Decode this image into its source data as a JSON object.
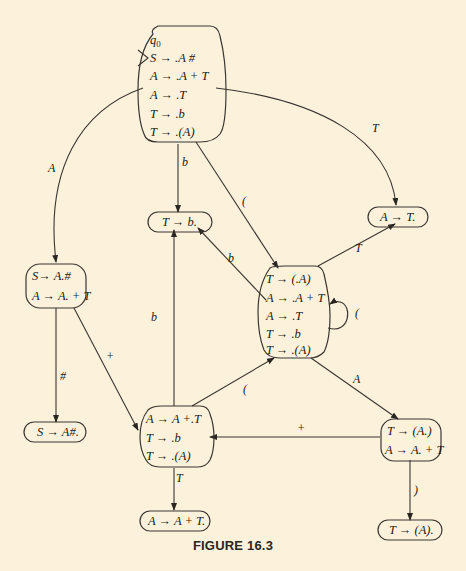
{
  "figure": {
    "caption": "FIGURE 16.3",
    "background": "#fcf2dc",
    "line_color": "#3a3530"
  },
  "nodes": {
    "q0": {
      "label": "q0",
      "items": [
        "S → .A #",
        "A → .A  + T",
        "A → .T",
        "T → .b",
        "T → .(A)"
      ],
      "start_state": true
    },
    "s_A_hash": {
      "items": [
        "S→ A.#",
        "A → A. + T"
      ]
    },
    "s_final": {
      "items": [
        "S → A#."
      ]
    },
    "t_b": {
      "items": [
        "T → b."
      ]
    },
    "a_T": {
      "items": [
        "A → T."
      ]
    },
    "t_paren": {
      "items": [
        "T → (.A)",
        "A → .A  + T",
        "A → .T",
        "T → .b",
        "T → .(A)"
      ]
    },
    "a_plus": {
      "items": [
        "A → A  +.T",
        "T → .b",
        "T → .(A)"
      ]
    },
    "a_plus_final": {
      "items": [
        "A → A + T."
      ]
    },
    "t_A_dot": {
      "items": [
        "T → (A.)",
        "A → A. + T"
      ]
    },
    "t_close": {
      "items": [
        "T → (A)."
      ]
    }
  },
  "edges": [
    {
      "from": "q0",
      "to": "s_A_hash",
      "label": "A"
    },
    {
      "from": "q0",
      "to": "t_b",
      "label": "b"
    },
    {
      "from": "q0",
      "to": "t_paren",
      "label": "("
    },
    {
      "from": "q0",
      "to": "a_T",
      "label": "T"
    },
    {
      "from": "s_A_hash",
      "to": "s_final",
      "label": "#"
    },
    {
      "from": "s_A_hash",
      "to": "a_plus",
      "label": "+"
    },
    {
      "from": "t_paren",
      "to": "t_b",
      "label": "b"
    },
    {
      "from": "t_paren",
      "to": "a_T",
      "label": "T"
    },
    {
      "from": "t_paren",
      "to": "t_paren",
      "label": "("
    },
    {
      "from": "t_paren",
      "to": "t_A_dot",
      "label": "A"
    },
    {
      "from": "a_plus",
      "to": "t_b",
      "label": "b"
    },
    {
      "from": "a_plus",
      "to": "t_paren",
      "label": "("
    },
    {
      "from": "a_plus",
      "to": "a_plus_final",
      "label": "T"
    },
    {
      "from": "t_A_dot",
      "to": "a_plus",
      "label": "+"
    },
    {
      "from": "t_A_dot",
      "to": "t_close",
      "label": ")"
    }
  ]
}
